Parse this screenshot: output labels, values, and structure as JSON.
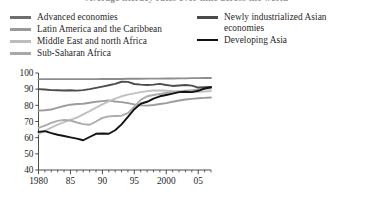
{
  "title": "Average literacy rates over time across the world",
  "legend": {
    "left": [
      {
        "label": "Advanced economies",
        "color": "#6e6e6e"
      },
      {
        "label": "Latin America and the Caribbean",
        "color": "#9a9a9a"
      },
      {
        "label": "Middle East and north Africa",
        "color": "#bdbdbd"
      },
      {
        "label": "Sub-Saharan Africa",
        "color": "#a8a8a8"
      }
    ],
    "right": [
      {
        "label_line1": "Newly industrialized Asian",
        "label_line2": "economies",
        "color": "#4a4a4a"
      },
      {
        "label_line1": "Developing Asia",
        "label_line2": "",
        "color": "#111111"
      }
    ]
  },
  "chart_data": {
    "type": "line",
    "title": "Average literacy rates over time across the world",
    "xlabel": "",
    "ylabel": "",
    "xlim": [
      1980,
      2007
    ],
    "ylim": [
      40,
      100
    ],
    "yticks": [
      40,
      50,
      60,
      70,
      80,
      90,
      100
    ],
    "ytick_labels": [
      "40",
      "50",
      "60",
      "70",
      "80",
      "90",
      "100"
    ],
    "xticks": [
      1980,
      1985,
      1990,
      1995,
      2000,
      2005
    ],
    "xtick_labels": [
      "1980",
      "85",
      "90",
      "95",
      "2000",
      "05"
    ],
    "minor_xticks_every": 1,
    "grid": false,
    "legend_position": "above-plot",
    "x": [
      1980,
      1981,
      1982,
      1983,
      1984,
      1985,
      1986,
      1987,
      1988,
      1989,
      1990,
      1991,
      1992,
      1993,
      1994,
      1995,
      1996,
      1997,
      1998,
      1999,
      2000,
      2001,
      2002,
      2003,
      2004,
      2005,
      2006,
      2007
    ],
    "series": [
      {
        "name": "Advanced economies",
        "color": "#8d8d8d",
        "values": [
          96.2,
          96.2,
          96.2,
          96.2,
          96.2,
          96.2,
          96.2,
          96.2,
          96.2,
          96.2,
          96.3,
          96.3,
          96.3,
          96.3,
          96.4,
          96.4,
          96.4,
          96.5,
          96.5,
          96.5,
          96.6,
          96.6,
          96.7,
          96.7,
          96.8,
          96.8,
          96.9,
          96.9
        ]
      },
      {
        "name": "Newly industrialized Asian economies",
        "color": "#4d4d4d",
        "values": [
          90.0,
          89.8,
          89.4,
          89.3,
          89.2,
          89.3,
          89.1,
          89.4,
          90.0,
          90.8,
          91.6,
          92.4,
          93.3,
          94.6,
          94.5,
          93.2,
          92.8,
          92.6,
          92.8,
          93.3,
          92.6,
          92.0,
          92.3,
          92.6,
          92.2,
          91.0,
          91.2,
          91.3
        ]
      },
      {
        "name": "Latin America and the Caribbean",
        "color": "#9c9c9c",
        "values": [
          76.8,
          77.0,
          77.4,
          78.6,
          79.6,
          80.4,
          80.8,
          81.0,
          81.6,
          82.2,
          82.6,
          83.0,
          82.4,
          82.0,
          81.4,
          80.6,
          80.0,
          79.8,
          80.2,
          80.8,
          81.4,
          82.2,
          83.0,
          83.6,
          84.0,
          84.4,
          84.6,
          84.8
        ]
      },
      {
        "name": "Middle East and north Africa",
        "color": "#c0c0c0",
        "values": [
          62.4,
          64.2,
          66.2,
          68.0,
          69.6,
          71.0,
          72.4,
          74.4,
          76.4,
          78.6,
          80.6,
          82.4,
          84.2,
          85.6,
          86.6,
          87.4,
          88.2,
          88.8,
          89.2,
          89.2,
          89.0,
          88.8,
          88.6,
          88.4,
          88.4,
          88.4,
          88.6,
          88.8
        ]
      },
      {
        "name": "Sub-Saharan Africa",
        "color": "#ababab",
        "values": [
          66.0,
          67.4,
          69.2,
          70.4,
          71.0,
          70.6,
          69.4,
          68.4,
          68.0,
          70.0,
          72.2,
          73.2,
          73.4,
          73.6,
          75.2,
          79.2,
          83.4,
          85.6,
          86.4,
          87.0,
          87.6,
          88.2,
          88.6,
          89.0,
          89.4,
          89.8,
          90.2,
          90.4
        ]
      },
      {
        "name": "Developing Asia",
        "color": "#131313",
        "values": [
          63.6,
          64.0,
          62.8,
          61.8,
          61.0,
          60.2,
          59.4,
          58.4,
          60.4,
          62.4,
          62.6,
          62.4,
          64.6,
          68.2,
          72.8,
          77.6,
          81.0,
          82.2,
          84.2,
          85.6,
          86.4,
          87.2,
          88.2,
          88.4,
          88.2,
          89.0,
          90.4,
          91.2
        ]
      }
    ]
  }
}
